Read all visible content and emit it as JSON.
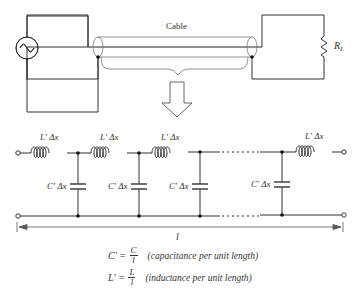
{
  "top_circuit": {
    "cable_label": "Cable",
    "load_label": "R",
    "load_subscript": "L",
    "source": "ac-source"
  },
  "ladder": {
    "sections": [
      {
        "inductor_label": "L′ Δx",
        "capacitor_label": "C′ Δx"
      },
      {
        "inductor_label": "L′ Δx",
        "capacitor_label": "C′ Δx"
      },
      {
        "inductor_label": "L′ Δx",
        "capacitor_label": "C′ Δx"
      },
      {
        "inductor_label": "L′ Δx",
        "capacitor_label": "C′ Δx"
      }
    ],
    "last_inductor_label": "L′ Δx",
    "length_label": "l"
  },
  "equations": [
    {
      "lhs": "C′",
      "eq": "=",
      "num": "C",
      "den": "l",
      "desc": "(capacitance per unit length)"
    },
    {
      "lhs": "L′",
      "eq": "=",
      "num": "L",
      "den": "l",
      "desc": "(inductance per unit length)"
    }
  ]
}
